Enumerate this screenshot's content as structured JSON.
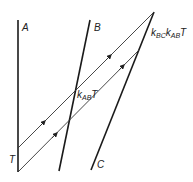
{
  "diagram": {
    "type": "spacetime-diagram",
    "worldlines": [
      {
        "id": "A",
        "label": "A"
      },
      {
        "id": "B",
        "label": "B"
      },
      {
        "id": "C",
        "label": "C"
      }
    ],
    "light_signals": [
      {
        "id": "signal-1",
        "direction": "A→C"
      },
      {
        "id": "signal-2",
        "direction": "A→C"
      }
    ],
    "labels": {
      "origin": "T",
      "at_B": {
        "k": "k",
        "sub": "AB",
        "var": "T"
      },
      "at_C": {
        "k1": "k",
        "sub1": "BC",
        "k2": "k",
        "sub2": "AB",
        "var": "T"
      }
    },
    "colors": {
      "line": "#1a1a1a",
      "signal": "#333333"
    }
  }
}
